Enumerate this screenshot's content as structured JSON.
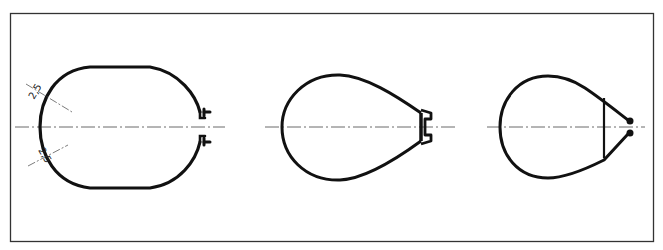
{
  "figure": {
    "type": "technical-drawing",
    "stroke_color": "#111111",
    "centerline_color": "#444444",
    "frame_color": "#333333"
  },
  "profiles": [
    {
      "id": "oval-with-flanges",
      "dimension_labels": [
        "2,5",
        "2,5"
      ]
    },
    {
      "id": "teardrop-with-c-channel"
    },
    {
      "id": "teardrop-with-bulb-tips"
    }
  ]
}
